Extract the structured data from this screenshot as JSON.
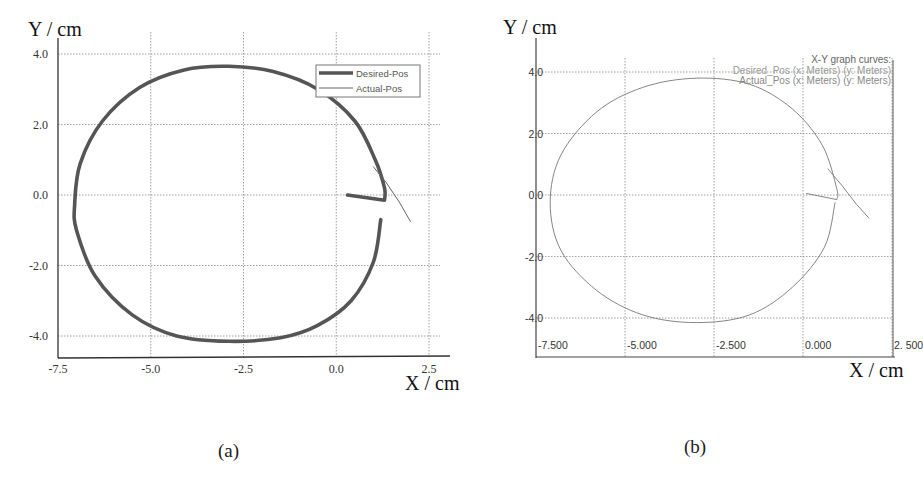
{
  "figure": {
    "panels": [
      {
        "id": "a",
        "label": "(a)"
      },
      {
        "id": "b",
        "label": "(b)"
      }
    ]
  },
  "panel_a": {
    "ylabel": "Y / cm",
    "xlabel": "X / cm",
    "yticks": [
      "4.0",
      "2.0",
      "0.0",
      "-2.0",
      "-4.0"
    ],
    "xticks": [
      "-7.5",
      "-5.0",
      "-2.5",
      "0.0",
      "2.5"
    ],
    "legend": {
      "desired": "Desired-Pos",
      "actual": "Actual-Pos"
    }
  },
  "panel_b": {
    "ylabel": "Y / cm",
    "xlabel": "X / cm",
    "yticks": [
      "4.0",
      "2.0",
      "0.0",
      "-2.0",
      "-4.0"
    ],
    "xticks": [
      "-7.500",
      "-5.000",
      "-2.500",
      "0.000",
      "2. 500"
    ],
    "legend": {
      "title": "X-Y graph curves:",
      "desired": "Desired_Pos (x: Meters) (y: Meters)",
      "actual": "Actual_Pos (x: Meters) (y: Meters)"
    }
  },
  "colors": {
    "desired_a": "#555555",
    "actual_a": "#666666",
    "curve_b": "#777777",
    "grid": "#888888",
    "axis": "#333333"
  },
  "chart_data": [
    {
      "type": "line",
      "panel": "(a)",
      "title": "",
      "xlabel": "X / cm",
      "ylabel": "Y / cm",
      "xlim": [
        -7.5,
        2.7
      ],
      "ylim": [
        -4.6,
        4.2
      ],
      "xticks": [
        -7.5,
        -5.0,
        -2.5,
        0.0,
        2.5
      ],
      "yticks": [
        -4.0,
        -2.0,
        0.0,
        2.0,
        4.0
      ],
      "grid": true,
      "legend_position": "upper right",
      "series": [
        {
          "name": "Desired-Pos",
          "style": "thick",
          "description": "near-circular trajectory, center approx (-2.95, -0.25), x-radius approx 4.1, y-radius approx 3.9; open near x=1.2, y in [-0.7, -0.15]; ends with a short segment back to (0.3, 0.0)",
          "x": [
            1.2,
            1.0,
            0.4,
            -0.5,
            -1.5,
            -2.9,
            -4.3,
            -5.5,
            -6.5,
            -7.0,
            -7.05,
            -6.9,
            -6.3,
            -5.3,
            -4.1,
            -2.9,
            -1.7,
            -0.5,
            0.5,
            1.05,
            1.3,
            1.3,
            0.3
          ],
          "y": [
            -0.7,
            -1.9,
            -3.0,
            -3.7,
            -4.05,
            -4.15,
            -4.0,
            -3.4,
            -2.3,
            -1.0,
            -0.25,
            0.9,
            2.1,
            3.05,
            3.55,
            3.65,
            3.5,
            3.0,
            2.1,
            1.0,
            0.2,
            -0.15,
            0.0
          ]
        },
        {
          "name": "Actual-Pos",
          "style": "thin",
          "x": [
            1.0,
            1.35,
            1.7,
            2.0
          ],
          "y": [
            0.8,
            0.35,
            -0.2,
            -0.75
          ]
        }
      ]
    },
    {
      "type": "line",
      "panel": "(b)",
      "title": "X-Y graph curves:",
      "xlabel": "X / cm",
      "ylabel": "Y / cm",
      "xlim": [
        -7.5,
        2.5
      ],
      "ylim": [
        -4.6,
        4.5
      ],
      "xticks": [
        -7.5,
        -5.0,
        -2.5,
        0.0,
        2.5
      ],
      "yticks": [
        -4.0,
        -2.0,
        0.0,
        2.0,
        4.0
      ],
      "grid": true,
      "legend_position": "upper right",
      "series": [
        {
          "name": "Desired_Pos (x: Meters) (y: Meters)",
          "style": "thin",
          "description": "near-circular trajectory, center approx (-3.0, -0.25), x-radius approx 4.0, y-radius approx 4.0, closed-looking with short segment to (0.1, 0.05)",
          "x": [
            0.9,
            0.6,
            -0.3,
            -1.5,
            -3.0,
            -4.5,
            -5.8,
            -6.8,
            -7.1,
            -6.8,
            -5.8,
            -4.5,
            -3.0,
            -1.5,
            -0.3,
            0.55,
            0.95,
            0.95,
            0.1
          ],
          "y": [
            -0.25,
            -1.7,
            -3.0,
            -3.9,
            -4.15,
            -3.9,
            -3.1,
            -1.8,
            -0.25,
            1.3,
            2.7,
            3.5,
            3.8,
            3.6,
            2.8,
            1.6,
            0.2,
            -0.15,
            0.05
          ]
        },
        {
          "name": "Actual_Pos (x: Meters) (y: Meters)",
          "style": "thin",
          "x": [
            0.7,
            1.1,
            1.5,
            1.85
          ],
          "y": [
            0.85,
            0.3,
            -0.3,
            -0.75
          ]
        }
      ]
    }
  ]
}
